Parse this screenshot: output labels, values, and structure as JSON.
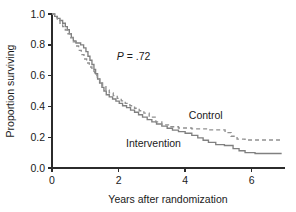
{
  "chart_data": {
    "type": "line",
    "title": "",
    "xlabel": "Years after randomization",
    "ylabel": "Proportion surviving",
    "xlim": [
      0,
      7
    ],
    "ylim": [
      0,
      1.0
    ],
    "xticks": [
      "0",
      "2",
      "4",
      "6"
    ],
    "xtick_values": [
      0,
      2,
      4,
      6
    ],
    "yticks": [
      "0.0",
      "0.2",
      "0.4",
      "0.6",
      "0.8",
      "1.0"
    ],
    "ytick_values": [
      0.0,
      0.2,
      0.4,
      0.6,
      0.8,
      1.0
    ],
    "grid": false,
    "legend_position": "inline-annotation",
    "annotations": [
      {
        "name": "p-value",
        "text_italic": "P",
        "text_plain": " = .72",
        "full_text": "P = .72",
        "x": 2.45,
        "y": 0.7
      }
    ],
    "series": [
      {
        "name": "Intervention",
        "style": "solid",
        "color": "#808080",
        "label_x": 3.05,
        "label_y": 0.135,
        "points": [
          [
            0.0,
            1.0
          ],
          [
            0.08,
            1.0
          ],
          [
            0.08,
            0.985
          ],
          [
            0.16,
            0.985
          ],
          [
            0.16,
            0.972
          ],
          [
            0.24,
            0.972
          ],
          [
            0.24,
            0.958
          ],
          [
            0.32,
            0.958
          ],
          [
            0.32,
            0.94
          ],
          [
            0.4,
            0.94
          ],
          [
            0.4,
            0.918
          ],
          [
            0.46,
            0.918
          ],
          [
            0.46,
            0.898
          ],
          [
            0.52,
            0.898
          ],
          [
            0.52,
            0.872
          ],
          [
            0.58,
            0.872
          ],
          [
            0.58,
            0.848
          ],
          [
            0.64,
            0.848
          ],
          [
            0.64,
            0.826
          ],
          [
            0.72,
            0.826
          ],
          [
            0.72,
            0.812
          ],
          [
            0.86,
            0.812
          ],
          [
            0.86,
            0.8
          ],
          [
            0.95,
            0.8
          ],
          [
            0.95,
            0.78
          ],
          [
            1.02,
            0.78
          ],
          [
            1.02,
            0.756
          ],
          [
            1.08,
            0.756
          ],
          [
            1.08,
            0.726
          ],
          [
            1.14,
            0.726
          ],
          [
            1.14,
            0.7
          ],
          [
            1.2,
            0.7
          ],
          [
            1.2,
            0.672
          ],
          [
            1.26,
            0.672
          ],
          [
            1.26,
            0.64
          ],
          [
            1.31,
            0.64
          ],
          [
            1.31,
            0.612
          ],
          [
            1.37,
            0.612
          ],
          [
            1.37,
            0.578
          ],
          [
            1.43,
            0.578
          ],
          [
            1.43,
            0.552
          ],
          [
            1.5,
            0.552
          ],
          [
            1.5,
            0.524
          ],
          [
            1.56,
            0.524
          ],
          [
            1.56,
            0.5
          ],
          [
            1.63,
            0.5
          ],
          [
            1.63,
            0.476
          ],
          [
            1.72,
            0.476
          ],
          [
            1.72,
            0.462
          ],
          [
            1.82,
            0.462
          ],
          [
            1.82,
            0.448
          ],
          [
            1.92,
            0.448
          ],
          [
            1.92,
            0.434
          ],
          [
            2.02,
            0.434
          ],
          [
            2.02,
            0.42
          ],
          [
            2.12,
            0.42
          ],
          [
            2.12,
            0.404
          ],
          [
            2.24,
            0.404
          ],
          [
            2.24,
            0.392
          ],
          [
            2.36,
            0.392
          ],
          [
            2.36,
            0.376
          ],
          [
            2.48,
            0.376
          ],
          [
            2.48,
            0.362
          ],
          [
            2.6,
            0.362
          ],
          [
            2.6,
            0.346
          ],
          [
            2.72,
            0.346
          ],
          [
            2.72,
            0.33
          ],
          [
            2.86,
            0.33
          ],
          [
            2.86,
            0.314
          ],
          [
            3.0,
            0.314
          ],
          [
            3.0,
            0.3
          ],
          [
            3.14,
            0.3
          ],
          [
            3.14,
            0.286
          ],
          [
            3.3,
            0.286
          ],
          [
            3.3,
            0.272
          ],
          [
            3.46,
            0.272
          ],
          [
            3.46,
            0.258
          ],
          [
            3.62,
            0.258
          ],
          [
            3.62,
            0.246
          ],
          [
            3.8,
            0.246
          ],
          [
            3.8,
            0.236
          ],
          [
            4.0,
            0.236
          ],
          [
            4.0,
            0.226
          ],
          [
            4.2,
            0.226
          ],
          [
            4.2,
            0.212
          ],
          [
            4.38,
            0.212
          ],
          [
            4.38,
            0.196
          ],
          [
            4.54,
            0.196
          ],
          [
            4.54,
            0.18
          ],
          [
            4.7,
            0.18
          ],
          [
            4.7,
            0.166
          ],
          [
            4.92,
            0.166
          ],
          [
            4.92,
            0.152
          ],
          [
            5.18,
            0.152
          ],
          [
            5.18,
            0.146
          ],
          [
            5.44,
            0.146
          ],
          [
            5.44,
            0.126
          ],
          [
            5.62,
            0.126
          ],
          [
            5.62,
            0.112
          ],
          [
            5.8,
            0.112
          ],
          [
            5.8,
            0.1
          ],
          [
            6.1,
            0.1
          ],
          [
            6.1,
            0.094
          ],
          [
            6.9,
            0.094
          ]
        ]
      },
      {
        "name": "Control",
        "style": "dashed",
        "color": "#909090",
        "label_x": 4.62,
        "label_y": 0.32,
        "points": [
          [
            0.0,
            1.0
          ],
          [
            0.08,
            1.0
          ],
          [
            0.08,
            0.98
          ],
          [
            0.16,
            0.98
          ],
          [
            0.16,
            0.962
          ],
          [
            0.24,
            0.962
          ],
          [
            0.24,
            0.94
          ],
          [
            0.32,
            0.94
          ],
          [
            0.32,
            0.918
          ],
          [
            0.4,
            0.918
          ],
          [
            0.4,
            0.896
          ],
          [
            0.48,
            0.896
          ],
          [
            0.48,
            0.872
          ],
          [
            0.56,
            0.872
          ],
          [
            0.56,
            0.846
          ],
          [
            0.64,
            0.846
          ],
          [
            0.64,
            0.82
          ],
          [
            0.72,
            0.82
          ],
          [
            0.72,
            0.792
          ],
          [
            0.8,
            0.792
          ],
          [
            0.8,
            0.764
          ],
          [
            0.88,
            0.764
          ],
          [
            0.88,
            0.736
          ],
          [
            0.96,
            0.736
          ],
          [
            0.96,
            0.708
          ],
          [
            1.04,
            0.708
          ],
          [
            1.04,
            0.682
          ],
          [
            1.12,
            0.682
          ],
          [
            1.12,
            0.656
          ],
          [
            1.2,
            0.656
          ],
          [
            1.2,
            0.63
          ],
          [
            1.28,
            0.63
          ],
          [
            1.28,
            0.604
          ],
          [
            1.36,
            0.604
          ],
          [
            1.36,
            0.578
          ],
          [
            1.44,
            0.578
          ],
          [
            1.44,
            0.552
          ],
          [
            1.52,
            0.552
          ],
          [
            1.52,
            0.528
          ],
          [
            1.62,
            0.528
          ],
          [
            1.62,
            0.506
          ],
          [
            1.72,
            0.506
          ],
          [
            1.72,
            0.488
          ],
          [
            1.84,
            0.488
          ],
          [
            1.84,
            0.47
          ],
          [
            1.96,
            0.47
          ],
          [
            1.96,
            0.452
          ],
          [
            2.08,
            0.452
          ],
          [
            2.08,
            0.436
          ],
          [
            2.2,
            0.436
          ],
          [
            2.2,
            0.42
          ],
          [
            2.34,
            0.42
          ],
          [
            2.34,
            0.404
          ],
          [
            2.48,
            0.404
          ],
          [
            2.48,
            0.388
          ],
          [
            2.62,
            0.388
          ],
          [
            2.62,
            0.372
          ],
          [
            2.76,
            0.372
          ],
          [
            2.76,
            0.356
          ],
          [
            2.92,
            0.356
          ],
          [
            2.92,
            0.33
          ],
          [
            3.12,
            0.33
          ],
          [
            3.12,
            0.3
          ],
          [
            3.3,
            0.3
          ],
          [
            3.3,
            0.28
          ],
          [
            3.52,
            0.28
          ],
          [
            3.52,
            0.268
          ],
          [
            3.8,
            0.268
          ],
          [
            3.8,
            0.26
          ],
          [
            4.2,
            0.26
          ],
          [
            4.2,
            0.254
          ],
          [
            4.7,
            0.254
          ],
          [
            4.7,
            0.248
          ],
          [
            5.2,
            0.248
          ],
          [
            5.2,
            0.23
          ],
          [
            5.38,
            0.23
          ],
          [
            5.38,
            0.206
          ],
          [
            5.56,
            0.206
          ],
          [
            5.56,
            0.188
          ],
          [
            5.8,
            0.188
          ],
          [
            5.8,
            0.182
          ],
          [
            6.9,
            0.182
          ]
        ]
      }
    ]
  },
  "axes": {
    "x_title": "Years after randomization",
    "y_title": "Proportion surviving"
  },
  "colors": {
    "axis": "#2b2b2b",
    "text": "#1a1a1a",
    "intervention_line": "#808080",
    "control_line": "#909090",
    "background": "#ffffff"
  }
}
